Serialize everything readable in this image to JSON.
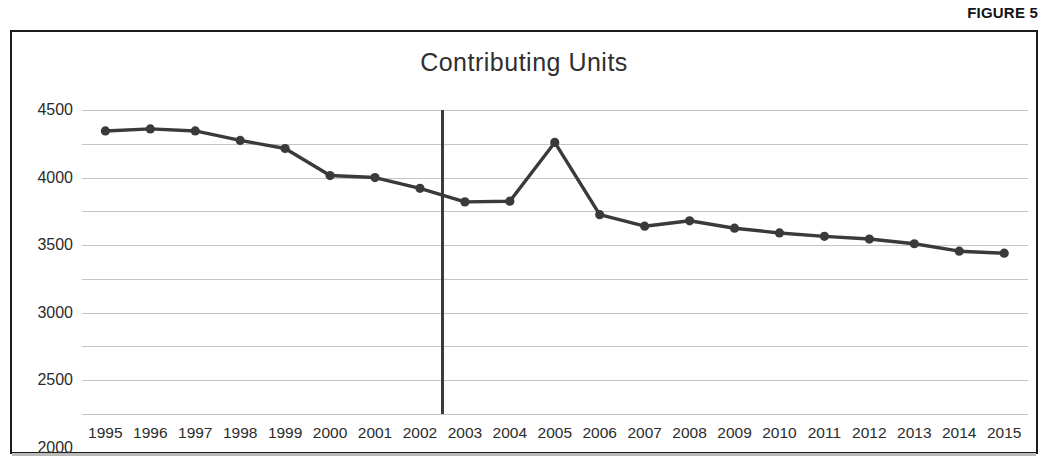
{
  "figure": {
    "caption": "FIGURE 5"
  },
  "chart_data": {
    "type": "line",
    "title": "Contributing Units",
    "xlabel": "",
    "ylabel": "",
    "grid": true,
    "legend": "none",
    "ylim": [
      0,
      4500
    ],
    "ytick_labels": [
      "4500",
      "4000",
      "3500",
      "3000",
      "2500",
      "2000",
      "1500",
      "1000",
      "500",
      "0"
    ],
    "yticks": [
      4500,
      4000,
      3500,
      3000,
      2500,
      2000,
      1500,
      1000,
      500,
      0
    ],
    "categories": [
      "1995",
      "1996",
      "1997",
      "1998",
      "1999",
      "2000",
      "2001",
      "2002",
      "2003",
      "2004",
      "2005",
      "2006",
      "2007",
      "2008",
      "2009",
      "2010",
      "2011",
      "2012",
      "2013",
      "2014",
      "2015"
    ],
    "values": [
      4190,
      4220,
      4190,
      4050,
      3930,
      3530,
      3500,
      3340,
      3140,
      3150,
      4020,
      2950,
      2780,
      2860,
      2750,
      2680,
      2630,
      2590,
      2520,
      2410,
      2380
    ],
    "series": [
      {
        "name": "Contributing Units",
        "color": "#3a3a3a",
        "marker": "circle",
        "values": [
          4190,
          4220,
          4190,
          4050,
          3930,
          3530,
          3500,
          3340,
          3140,
          3150,
          4020,
          2950,
          2780,
          2860,
          2750,
          2680,
          2630,
          2590,
          2520,
          2410,
          2380
        ]
      }
    ],
    "annotations": [
      {
        "type": "vertical-rule",
        "at_category_index": 7.5,
        "between": [
          "2002",
          "2003"
        ],
        "color": "#3a3a3a"
      }
    ],
    "colors": {
      "line": "#3a3a3a",
      "marker": "#3a3a3a",
      "gridline": "#c4c4c4",
      "border": "#1b1b1b",
      "text": "#2b2b2b",
      "title": "#2f2f2f",
      "background": "#ffffff"
    }
  }
}
